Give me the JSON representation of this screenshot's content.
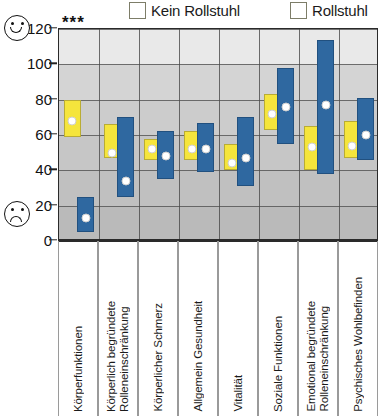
{
  "legend": {
    "entries": [
      {
        "label": "Kein Rollstuhl",
        "color": "#f5e53c",
        "name": "no-wheelchair"
      },
      {
        "label": "Rollstuhl",
        "color": "#2f68a0",
        "name": "wheelchair"
      }
    ]
  },
  "annotations": {
    "significance": "***",
    "significance_category": "Körperfunktionen"
  },
  "axis_icons": {
    "top": "smiley-face-icon",
    "bottom": "sad-face-icon"
  },
  "chart_data": {
    "type": "bar",
    "title": "",
    "subtitle": "",
    "xlabel": "",
    "ylabel": "",
    "ylim": [
      0,
      120
    ],
    "yticks": [
      0,
      20,
      40,
      60,
      80,
      100,
      120
    ],
    "ytick_labels": [
      "0",
      "20",
      "40",
      "60",
      "80",
      "100",
      "120"
    ],
    "grid": true,
    "legend_position": "top",
    "note": "Paired range bars (box style) with white median marker dots; value ranges read off gridlines.",
    "categories": [
      "Körperfunktionen",
      "Körperlich begründete Rolleneinschränkung",
      "Körperlicher Schmerz",
      "Allgemein Gesundheit",
      "Vitalität",
      "Soziale Funktionen",
      "Emotional begründete Rolleneinschränkung",
      "Psychisches Wohlbefinden"
    ],
    "series": [
      {
        "name": "Kein Rollstuhl",
        "color": "#f5e53c",
        "low": [
          59,
          47,
          46,
          46,
          40,
          63,
          40,
          47
        ],
        "high": [
          80,
          66,
          58,
          62,
          55,
          83,
          65,
          68
        ],
        "values": [
          68,
          50,
          52,
          52,
          44,
          72,
          53,
          54
        ]
      },
      {
        "name": "Rollstuhl",
        "color": "#2f68a0",
        "low": [
          5,
          25,
          35,
          39,
          31,
          55,
          38,
          46
        ],
        "high": [
          25,
          70,
          62,
          67,
          70,
          98,
          114,
          81
        ],
        "values": [
          13,
          34,
          48,
          52,
          47,
          76,
          77,
          60
        ]
      }
    ]
  },
  "xlabels_multiline": [
    "Körperfunktionen",
    "Körperlich begründete\nRolleneinschränkung",
    "Körperlicher Schmerz",
    "Allgemein Gesundheit",
    "Vitalität",
    "Soziale Funktionen",
    "Emotional begründete\nRolleneinschränkung",
    "Psychisches Wohlbefinden"
  ]
}
